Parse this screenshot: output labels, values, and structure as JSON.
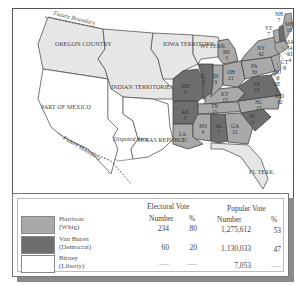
{
  "map": {
    "regions": {
      "oregon": "OREGON COUNTRY",
      "iowa": "IOWA TERRITORY",
      "indian": "INDIAN TERRITORIES",
      "mexico": "PART OF MEXICO",
      "disputed": "Disputed Area",
      "texas": "TEXAS REPUBLIC",
      "wi": "WI TERR.",
      "fl": "FL TERR.",
      "boundary_north": "Future Boundary",
      "boundary_south": "Future Boundary"
    },
    "states": [
      {
        "abbr": "ME",
        "votes": "10"
      },
      {
        "abbr": "NH",
        "votes": "7"
      },
      {
        "abbr": "VT",
        "votes": "7"
      },
      {
        "abbr": "MA",
        "votes": "14"
      },
      {
        "abbr": "RI",
        "votes": "4"
      },
      {
        "abbr": "CT",
        "votes": "8"
      },
      {
        "abbr": "NY",
        "votes": "42"
      },
      {
        "abbr": "NJ",
        "votes": "8"
      },
      {
        "abbr": "DE",
        "votes": "3"
      },
      {
        "abbr": "MD",
        "votes": "10"
      },
      {
        "abbr": "PA",
        "votes": "30"
      },
      {
        "abbr": "OH",
        "votes": "21"
      },
      {
        "abbr": "MI",
        "votes": "3"
      },
      {
        "abbr": "IN",
        "votes": "9"
      },
      {
        "abbr": "IL",
        "votes": "5"
      },
      {
        "abbr": "MO",
        "votes": "4"
      },
      {
        "abbr": "KY",
        "votes": "15"
      },
      {
        "abbr": "VA",
        "votes": "23"
      },
      {
        "abbr": "NC",
        "votes": "15"
      },
      {
        "abbr": "TN",
        "votes": "15"
      },
      {
        "abbr": "SC",
        "votes": "11"
      },
      {
        "abbr": "GA",
        "votes": "11"
      },
      {
        "abbr": "AL",
        "votes": "7"
      },
      {
        "abbr": "MS",
        "votes": "4"
      },
      {
        "abbr": "LA",
        "votes": "5"
      },
      {
        "abbr": "AR",
        "votes": "3"
      }
    ]
  },
  "legend": {
    "electoral_header": "Electoral Vote",
    "popular_header": "Popular Vote",
    "col_number": "Number",
    "col_percent": "%",
    "rows": [
      {
        "name": "Harrison",
        "party": "(Whig)",
        "color": "#a9a9a9",
        "ev_num": "234",
        "ev_pct": "80",
        "pv_num": "1,275,612",
        "pv_pct": "53"
      },
      {
        "name": "Van Buren",
        "party": "(Democrat)",
        "color": "#6e6e6e",
        "ev_num": "60",
        "ev_pct": "20",
        "pv_num": "1,130,033",
        "pv_pct": "47"
      },
      {
        "name": "Birney",
        "party": "(Liberty)",
        "color": "#ffffff",
        "ev_num": "----",
        "ev_pct": "----",
        "pv_num": "7,053",
        "pv_pct": "----"
      }
    ]
  },
  "colors": {
    "whig": "#a9a9a9",
    "democrat": "#6e6e6e",
    "territory": "#e6e6e6",
    "foreign": "#ffffff"
  }
}
